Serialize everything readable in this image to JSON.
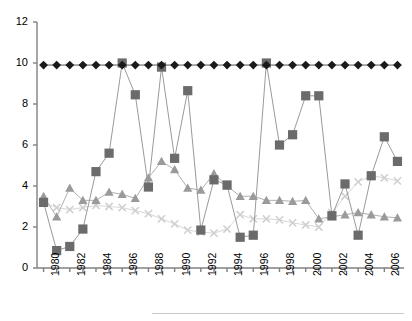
{
  "chart_data": {
    "type": "line",
    "title": "",
    "subtitle": "",
    "xlabel": "",
    "ylabel": "",
    "xlim": [
      1979.5,
      2007.5
    ],
    "ylim": [
      0,
      12
    ],
    "grid": false,
    "legend_position": "bottom",
    "y_ticks": [
      0,
      2,
      4,
      6,
      8,
      10,
      12
    ],
    "x_ticks": [
      1980,
      1981,
      1982,
      1983,
      1984,
      1985,
      1986,
      1987,
      1988,
      1989,
      1990,
      1991,
      1992,
      1993,
      1994,
      1995,
      1996,
      1997,
      1998,
      1999,
      2000,
      2001,
      2002,
      2003,
      2004,
      2005,
      2006,
      2007
    ],
    "x_tick_labels": [
      "1980",
      "",
      "1982",
      "",
      "1984",
      "",
      "1986",
      "",
      "1988",
      "",
      "1990",
      "",
      "1992",
      "",
      "1994",
      "",
      "1996",
      "",
      "1998",
      "",
      "2000",
      "",
      "2002",
      "",
      "2004",
      "",
      "2006",
      ""
    ],
    "x": [
      1980,
      1981,
      1982,
      1983,
      1984,
      1985,
      1986,
      1987,
      1988,
      1989,
      1990,
      1991,
      1992,
      1993,
      1994,
      1995,
      1996,
      1997,
      1998,
      1999,
      2000,
      2001,
      2002,
      2003,
      2004,
      2005,
      2006,
      2007
    ],
    "series": [
      {
        "name": "series-diamond",
        "marker": "diamond",
        "color": "#1a1a1a",
        "line_color": "#555555",
        "values": [
          9.9,
          9.9,
          9.9,
          9.9,
          9.9,
          9.9,
          9.9,
          9.9,
          9.9,
          9.9,
          9.9,
          9.9,
          9.9,
          9.9,
          9.9,
          9.9,
          9.9,
          9.9,
          9.9,
          9.9,
          9.9,
          9.9,
          9.9,
          9.9,
          9.9,
          9.9,
          9.9,
          9.9
        ]
      },
      {
        "name": "series-square",
        "marker": "square",
        "color": "#6b6b6b",
        "line_color": "#9a9a9a",
        "values": [
          3.2,
          0.85,
          1.05,
          1.9,
          4.7,
          5.6,
          10.0,
          8.45,
          3.95,
          9.8,
          5.35,
          8.65,
          1.85,
          4.3,
          4.05,
          1.5,
          1.6,
          10.0,
          6.0,
          6.5,
          8.4,
          8.4,
          2.55,
          4.1,
          1.6,
          4.5,
          6.4,
          5.2
        ]
      },
      {
        "name": "series-triangle",
        "marker": "triangle",
        "color": "#9a9a9a",
        "line_color": "#b0b0b0",
        "values": [
          3.5,
          2.5,
          3.9,
          3.3,
          3.3,
          3.7,
          3.6,
          3.4,
          4.4,
          5.2,
          4.8,
          3.9,
          3.8,
          4.6,
          4.0,
          3.5,
          3.5,
          3.3,
          3.3,
          3.25,
          3.3,
          2.4,
          2.5,
          2.6,
          2.7,
          2.6,
          2.5,
          2.45
        ]
      },
      {
        "name": "series-cross",
        "marker": "x",
        "color": "#cfcfcf",
        "line_color": "#d8d8d8",
        "values": [
          3.2,
          2.95,
          2.85,
          2.95,
          3.05,
          3.0,
          2.95,
          2.8,
          2.65,
          2.4,
          2.15,
          1.85,
          1.75,
          1.7,
          1.9,
          2.6,
          2.4,
          2.4,
          2.35,
          2.2,
          2.1,
          2.0,
          2.7,
          3.5,
          4.2,
          4.5,
          4.4,
          4.25
        ]
      }
    ]
  },
  "axes": {
    "y_axis_name": "y-axis",
    "x_axis_name": "x-axis"
  },
  "legend": {
    "visible": false,
    "note": ""
  }
}
